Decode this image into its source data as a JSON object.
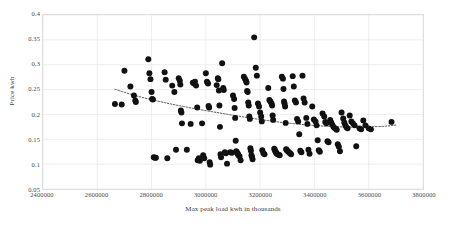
{
  "chart_data": {
    "type": "scatter",
    "title": "",
    "xlabel": "Max peak load kwh in thousands",
    "ylabel": "Price kwh",
    "xlim": [
      2400000,
      3800000
    ],
    "ylim": [
      0.05,
      0.4
    ],
    "xticks": [
      2400000,
      2600000,
      2800000,
      3000000,
      3200000,
      3400000,
      3600000,
      3800000
    ],
    "xtick_labels": [
      "2400000",
      "2600000",
      "2800000",
      "3000000",
      "3200000",
      "3400000",
      "3600000",
      "3800000"
    ],
    "yticks": [
      0.05,
      0.1,
      0.15,
      0.2,
      0.25,
      0.3,
      0.35,
      0.4
    ],
    "ytick_labels": [
      "0.05",
      "0.1",
      "0.15",
      "0.2",
      "0.25",
      "0.3",
      "0.35",
      "0.4"
    ],
    "grid": true,
    "grid_color": "#e6e6e6",
    "legend": false,
    "legend_position": "none",
    "marker_color": "#111111",
    "marker_size": 3.0,
    "series": [
      {
        "name": "Price vs Max peak load",
        "marker": "circle",
        "points": [
          [
            2665000,
            0.221
          ],
          [
            2690000,
            0.22
          ],
          [
            2700000,
            0.288
          ],
          [
            2722000,
            0.256
          ],
          [
            2735000,
            0.238
          ],
          [
            2740000,
            0.228
          ],
          [
            2742000,
            0.225
          ],
          [
            2788000,
            0.311
          ],
          [
            2792000,
            0.283
          ],
          [
            2796000,
            0.271
          ],
          [
            2800000,
            0.245
          ],
          [
            2802000,
            0.231
          ],
          [
            2805000,
            0.23
          ],
          [
            2808000,
            0.114
          ],
          [
            2812000,
            0.113
          ],
          [
            2816000,
            0.113
          ],
          [
            2848000,
            0.285
          ],
          [
            2852000,
            0.27
          ],
          [
            2858000,
            0.112
          ],
          [
            2876000,
            0.258
          ],
          [
            2884000,
            0.245
          ],
          [
            2890000,
            0.129
          ],
          [
            2900000,
            0.273
          ],
          [
            2904000,
            0.268
          ],
          [
            2906000,
            0.26
          ],
          [
            2908000,
            0.208
          ],
          [
            2910000,
            0.204
          ],
          [
            2912000,
            0.182
          ],
          [
            2930000,
            0.129
          ],
          [
            2944000,
            0.181
          ],
          [
            2952000,
            0.264
          ],
          [
            2956000,
            0.262
          ],
          [
            2960000,
            0.266
          ],
          [
            2964000,
            0.258
          ],
          [
            2968000,
            0.214
          ],
          [
            2970000,
            0.108
          ],
          [
            2974000,
            0.112
          ],
          [
            2978000,
            0.107
          ],
          [
            2986000,
            0.182
          ],
          [
            2990000,
            0.118
          ],
          [
            2994000,
            0.112
          ],
          [
            3000000,
            0.283
          ],
          [
            3004000,
            0.266
          ],
          [
            3006000,
            0.264
          ],
          [
            3008000,
            0.262
          ],
          [
            3010000,
            0.217
          ],
          [
            3012000,
            0.214
          ],
          [
            3014000,
            0.104
          ],
          [
            3016000,
            0.099
          ],
          [
            3040000,
            0.259
          ],
          [
            3044000,
            0.273
          ],
          [
            3046000,
            0.271
          ],
          [
            3048000,
            0.248
          ],
          [
            3050000,
            0.218
          ],
          [
            3052000,
            0.175
          ],
          [
            3054000,
            0.12
          ],
          [
            3056000,
            0.114
          ],
          [
            3060000,
            0.303
          ],
          [
            3064000,
            0.253
          ],
          [
            3066000,
            0.249
          ],
          [
            3070000,
            0.124
          ],
          [
            3074000,
            0.122
          ],
          [
            3078000,
            0.101
          ],
          [
            3090000,
            0.124
          ],
          [
            3096000,
            0.123
          ],
          [
            3100000,
            0.238
          ],
          [
            3104000,
            0.231
          ],
          [
            3106000,
            0.213
          ],
          [
            3108000,
            0.193
          ],
          [
            3110000,
            0.147
          ],
          [
            3112000,
            0.126
          ],
          [
            3114000,
            0.124
          ],
          [
            3116000,
            0.122
          ],
          [
            3118000,
            0.121
          ],
          [
            3120000,
            0.118
          ],
          [
            3124000,
            0.116
          ],
          [
            3128000,
            0.108
          ],
          [
            3140000,
            0.276
          ],
          [
            3144000,
            0.272
          ],
          [
            3148000,
            0.268
          ],
          [
            3150000,
            0.264
          ],
          [
            3152000,
            0.247
          ],
          [
            3154000,
            0.245
          ],
          [
            3156000,
            0.224
          ],
          [
            3158000,
            0.218
          ],
          [
            3160000,
            0.196
          ],
          [
            3162000,
            0.191
          ],
          [
            3164000,
            0.132
          ],
          [
            3166000,
            0.127
          ],
          [
            3168000,
            0.118
          ],
          [
            3170000,
            0.115
          ],
          [
            3172000,
            0.11
          ],
          [
            3178000,
            0.355
          ],
          [
            3184000,
            0.294
          ],
          [
            3188000,
            0.278
          ],
          [
            3192000,
            0.222
          ],
          [
            3196000,
            0.216
          ],
          [
            3200000,
            0.204
          ],
          [
            3204000,
            0.196
          ],
          [
            3206000,
            0.186
          ],
          [
            3208000,
            0.128
          ],
          [
            3212000,
            0.122
          ],
          [
            3216000,
            0.12
          ],
          [
            3230000,
            0.253
          ],
          [
            3234000,
            0.229
          ],
          [
            3238000,
            0.226
          ],
          [
            3242000,
            0.222
          ],
          [
            3244000,
            0.218
          ],
          [
            3246000,
            0.198
          ],
          [
            3248000,
            0.189
          ],
          [
            3252000,
            0.131
          ],
          [
            3254000,
            0.129
          ],
          [
            3256000,
            0.126
          ],
          [
            3258000,
            0.124
          ],
          [
            3260000,
            0.122
          ],
          [
            3264000,
            0.12
          ],
          [
            3268000,
            0.119
          ],
          [
            3272000,
            0.118
          ],
          [
            3280000,
            0.276
          ],
          [
            3284000,
            0.272
          ],
          [
            3286000,
            0.251
          ],
          [
            3288000,
            0.226
          ],
          [
            3290000,
            0.222
          ],
          [
            3292000,
            0.216
          ],
          [
            3294000,
            0.183
          ],
          [
            3296000,
            0.13
          ],
          [
            3298000,
            0.128
          ],
          [
            3302000,
            0.126
          ],
          [
            3306000,
            0.124
          ],
          [
            3310000,
            0.122
          ],
          [
            3314000,
            0.12
          ],
          [
            3320000,
            0.277
          ],
          [
            3324000,
            0.256
          ],
          [
            3328000,
            0.228
          ],
          [
            3332000,
            0.224
          ],
          [
            3336000,
            0.191
          ],
          [
            3340000,
            0.186
          ],
          [
            3344000,
            0.16
          ],
          [
            3348000,
            0.127
          ],
          [
            3352000,
            0.124
          ],
          [
            3356000,
            0.278
          ],
          [
            3360000,
            0.232
          ],
          [
            3364000,
            0.224
          ],
          [
            3370000,
            0.193
          ],
          [
            3374000,
            0.181
          ],
          [
            3378000,
            0.129
          ],
          [
            3382000,
            0.121
          ],
          [
            3392000,
            0.216
          ],
          [
            3398000,
            0.19
          ],
          [
            3404000,
            0.186
          ],
          [
            3408000,
            0.178
          ],
          [
            3412000,
            0.148
          ],
          [
            3416000,
            0.128
          ],
          [
            3420000,
            0.125
          ],
          [
            3430000,
            0.202
          ],
          [
            3436000,
            0.196
          ],
          [
            3440000,
            0.185
          ],
          [
            3444000,
            0.182
          ],
          [
            3448000,
            0.146
          ],
          [
            3452000,
            0.144
          ],
          [
            3458000,
            0.189
          ],
          [
            3462000,
            0.184
          ],
          [
            3466000,
            0.179
          ],
          [
            3470000,
            0.175
          ],
          [
            3474000,
            0.173
          ],
          [
            3478000,
            0.171
          ],
          [
            3482000,
            0.169
          ],
          [
            3486000,
            0.14
          ],
          [
            3490000,
            0.135
          ],
          [
            3494000,
            0.126
          ],
          [
            3500000,
            0.204
          ],
          [
            3506000,
            0.192
          ],
          [
            3510000,
            0.184
          ],
          [
            3514000,
            0.178
          ],
          [
            3518000,
            0.174
          ],
          [
            3522000,
            0.172
          ],
          [
            3530000,
            0.198
          ],
          [
            3536000,
            0.186
          ],
          [
            3542000,
            0.182
          ],
          [
            3548000,
            0.178
          ],
          [
            3554000,
            0.136
          ],
          [
            3566000,
            0.172
          ],
          [
            3572000,
            0.17
          ],
          [
            3580000,
            0.188
          ],
          [
            3588000,
            0.178
          ],
          [
            3600000,
            0.172
          ],
          [
            3608000,
            0.17
          ],
          [
            3684000,
            0.185
          ]
        ]
      }
    ],
    "trendline": {
      "style": "dotted",
      "color": "#3f3f3f",
      "x_start": 2665000,
      "x_end": 3700000,
      "points": [
        [
          2665000,
          0.2505
        ],
        [
          2750000,
          0.2365
        ],
        [
          2850000,
          0.2235
        ],
        [
          2950000,
          0.2125
        ],
        [
          3050000,
          0.203
        ],
        [
          3150000,
          0.194
        ],
        [
          3250000,
          0.186
        ],
        [
          3350000,
          0.18
        ],
        [
          3450000,
          0.176
        ],
        [
          3550000,
          0.1745
        ],
        [
          3650000,
          0.176
        ],
        [
          3700000,
          0.1785
        ]
      ]
    }
  }
}
